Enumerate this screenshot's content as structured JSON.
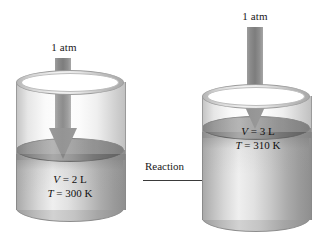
{
  "figure": {
    "background_color": "#ffffff",
    "arrow_color": "#7d7d7d",
    "reaction_arrow_color": "#3a3a3a"
  },
  "left_cylinder": {
    "pressure_label": "1 atm",
    "volume_line": "V = 2 L",
    "temperature_line": "T = 300 K",
    "volume_symbol": "V",
    "volume_value": "= 2 L",
    "temperature_symbol": "T",
    "temperature_value": "= 300 K"
  },
  "right_cylinder": {
    "pressure_label": "1 atm",
    "volume_line": "V = 3 L",
    "temperature_line": "T = 310 K",
    "volume_symbol": "V",
    "volume_value": "= 3 L",
    "temperature_symbol": "T",
    "temperature_value": "= 310 K"
  },
  "transition": {
    "label": "Reaction"
  }
}
